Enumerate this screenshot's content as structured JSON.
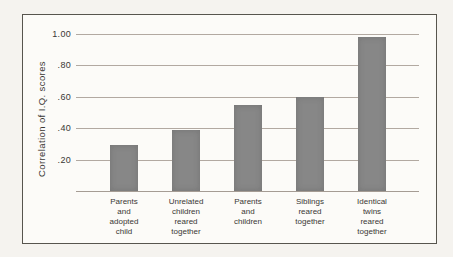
{
  "chart_data": {
    "type": "bar",
    "title": "",
    "xlabel": "",
    "ylabel": "Correlation of I.Q. scores",
    "categories": [
      "Parents\nand\nadopted\nchild",
      "Unrelated\nchildren\nreared\ntogether",
      "Parents\nand\nchildren",
      "Siblings\nreared\ntogether",
      "Identical\ntwins\nreared\ntogether"
    ],
    "values": [
      0.29,
      0.39,
      0.55,
      0.6,
      0.98
    ],
    "yticks": [
      1.0,
      0.8,
      0.6,
      0.4,
      0.2
    ],
    "ytick_labels": [
      "1.00",
      ".80",
      ".60",
      ".40",
      ".20"
    ],
    "ylim": [
      0,
      1.05
    ],
    "grid": true,
    "legend": false,
    "bar_color": "#878787",
    "gridline_color": "#b2a9a1",
    "frame_border_color": "#57554e"
  }
}
